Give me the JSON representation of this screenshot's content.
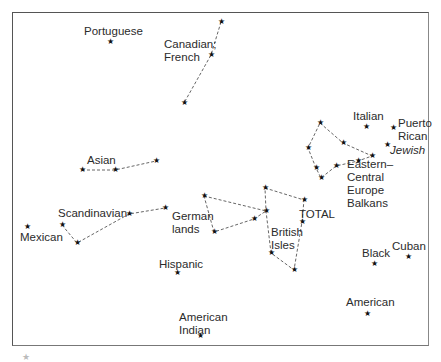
{
  "diagram": {
    "star_glyph": "★",
    "line_color": "#555555",
    "labels": [
      {
        "id": "portuguese",
        "text": "Portuguese",
        "x": 84,
        "y": 25,
        "italic": false
      },
      {
        "id": "canadian-french",
        "text": "Canadian;\nFrench",
        "x": 164,
        "y": 38,
        "italic": false
      },
      {
        "id": "asian",
        "text": "Asian",
        "x": 87,
        "y": 154,
        "italic": false
      },
      {
        "id": "italian",
        "text": "Italian",
        "x": 353,
        "y": 110,
        "italic": false
      },
      {
        "id": "puerto-rican",
        "text": "Puerto\nRican",
        "x": 398,
        "y": 117,
        "italic": false
      },
      {
        "id": "jewish",
        "text": "Jewish",
        "x": 390,
        "y": 144,
        "italic": true
      },
      {
        "id": "eastern-central-europe-balkans",
        "text": "Eastern–\nCentral\nEurope\nBalkans",
        "x": 347,
        "y": 158,
        "italic": false
      },
      {
        "id": "scandinavian",
        "text": "Scandinavian",
        "x": 58,
        "y": 207,
        "italic": false
      },
      {
        "id": "mexican",
        "text": "Mexican",
        "x": 20,
        "y": 231,
        "italic": false
      },
      {
        "id": "german-lands",
        "text": "German\nlands",
        "x": 172,
        "y": 210,
        "italic": false
      },
      {
        "id": "total",
        "text": "TOTAL",
        "x": 299,
        "y": 208,
        "italic": false
      },
      {
        "id": "british-isles",
        "text": "British\nIsles",
        "x": 271,
        "y": 226,
        "italic": false
      },
      {
        "id": "hispanic",
        "text": "Hispanic",
        "x": 159,
        "y": 258,
        "italic": false
      },
      {
        "id": "black",
        "text": "Black",
        "x": 362,
        "y": 247,
        "italic": false
      },
      {
        "id": "cuban",
        "text": "Cuban",
        "x": 392,
        "y": 240,
        "italic": false
      },
      {
        "id": "american",
        "text": "American",
        "x": 346,
        "y": 296,
        "italic": false
      },
      {
        "id": "american-indian",
        "text": "American\nIndian",
        "x": 179,
        "y": 311,
        "italic": false
      }
    ],
    "stars": [
      {
        "group": "portuguese",
        "x": 110,
        "y": 42
      },
      {
        "group": "canadian-french",
        "x": 221,
        "y": 22
      },
      {
        "group": "canadian-french",
        "x": 211,
        "y": 55
      },
      {
        "group": "canadian-french",
        "x": 184,
        "y": 103
      },
      {
        "group": "asian",
        "x": 82,
        "y": 170
      },
      {
        "group": "asian",
        "x": 115,
        "y": 170
      },
      {
        "group": "asian",
        "x": 156,
        "y": 161
      },
      {
        "group": "italian",
        "x": 366,
        "y": 127
      },
      {
        "group": "puerto-rican",
        "x": 393,
        "y": 128
      },
      {
        "group": "jewish",
        "x": 387,
        "y": 145
      },
      {
        "group": "eastern",
        "x": 320,
        "y": 123
      },
      {
        "group": "eastern",
        "x": 308,
        "y": 148
      },
      {
        "group": "eastern",
        "x": 343,
        "y": 143
      },
      {
        "group": "eastern",
        "x": 372,
        "y": 156
      },
      {
        "group": "eastern",
        "x": 358,
        "y": 161
      },
      {
        "group": "eastern",
        "x": 336,
        "y": 166
      },
      {
        "group": "eastern",
        "x": 316,
        "y": 168
      },
      {
        "group": "eastern",
        "x": 321,
        "y": 178
      },
      {
        "group": "mexican",
        "x": 27,
        "y": 227
      },
      {
        "group": "scandinavian",
        "x": 62,
        "y": 225
      },
      {
        "group": "scandinavian",
        "x": 77,
        "y": 243
      },
      {
        "group": "scandinavian",
        "x": 129,
        "y": 214
      },
      {
        "group": "scandinavian",
        "x": 165,
        "y": 208
      },
      {
        "group": "german",
        "x": 204,
        "y": 196
      },
      {
        "group": "german",
        "x": 214,
        "y": 232
      },
      {
        "group": "german",
        "x": 254,
        "y": 219
      },
      {
        "group": "british",
        "x": 265,
        "y": 188
      },
      {
        "group": "british",
        "x": 266,
        "y": 211
      },
      {
        "group": "british",
        "x": 304,
        "y": 200
      },
      {
        "group": "british",
        "x": 302,
        "y": 222
      },
      {
        "group": "british",
        "x": 271,
        "y": 253
      },
      {
        "group": "british",
        "x": 294,
        "y": 270
      },
      {
        "group": "hispanic",
        "x": 177,
        "y": 273
      },
      {
        "group": "american-indian",
        "x": 200,
        "y": 336
      },
      {
        "group": "black",
        "x": 374,
        "y": 264
      },
      {
        "group": "cuban",
        "x": 408,
        "y": 257
      },
      {
        "group": "american",
        "x": 367,
        "y": 314
      }
    ],
    "paths": [
      {
        "id": "canadian-french-line",
        "points": [
          [
            221,
            22
          ],
          [
            211,
            55
          ],
          [
            184,
            103
          ]
        ]
      },
      {
        "id": "asian-line",
        "points": [
          [
            82,
            170
          ],
          [
            115,
            170
          ],
          [
            156,
            161
          ]
        ]
      },
      {
        "id": "eastern-polygon",
        "points": [
          [
            320,
            123
          ],
          [
            343,
            143
          ],
          [
            372,
            156
          ],
          [
            358,
            161
          ],
          [
            336,
            166
          ],
          [
            321,
            178
          ],
          [
            316,
            168
          ],
          [
            308,
            148
          ],
          [
            320,
            123
          ]
        ]
      },
      {
        "id": "scandinavian-line",
        "points": [
          [
            62,
            225
          ],
          [
            77,
            243
          ],
          [
            129,
            214
          ],
          [
            165,
            208
          ]
        ]
      },
      {
        "id": "german-polygon",
        "points": [
          [
            204,
            196
          ],
          [
            266,
            211
          ],
          [
            254,
            219
          ],
          [
            214,
            232
          ],
          [
            204,
            196
          ]
        ]
      },
      {
        "id": "british-polygon",
        "points": [
          [
            265,
            188
          ],
          [
            304,
            200
          ],
          [
            302,
            222
          ],
          [
            294,
            270
          ],
          [
            271,
            253
          ],
          [
            266,
            211
          ],
          [
            265,
            188
          ]
        ]
      }
    ]
  },
  "caption": {
    "star_glyph": "★"
  }
}
